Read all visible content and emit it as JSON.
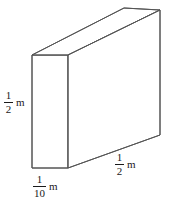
{
  "figure": {
    "background_color": "#ffffff",
    "line_color": "#555555",
    "text_color": "#1a1a1a",
    "shape": "rectangular-prism",
    "unit": "m"
  },
  "labels": {
    "height": {
      "numerator": "1",
      "denominator": "2",
      "unit": "m",
      "position": "left"
    },
    "depth": {
      "numerator": "1",
      "denominator": "10",
      "unit": "m",
      "position": "bottom"
    },
    "length": {
      "numerator": "1",
      "denominator": "2",
      "unit": "m",
      "position": "bottom-right"
    }
  },
  "geometry": {
    "front_top_left": "32,55",
    "front_top_right": "68,55",
    "front_bottom_right": "68,168",
    "front_bottom_left": "32,168",
    "back_top_left": "124,8",
    "back_top_right": "160,10",
    "back_bottom_right": "160,135"
  }
}
